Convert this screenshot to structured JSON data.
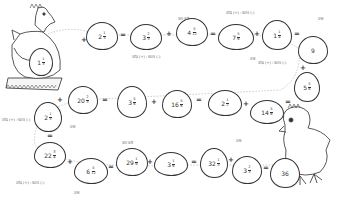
{
  "worksheet": {
    "eggs": [
      {
        "id": "e1",
        "whole": "1",
        "num": "1",
        "den": "3"
      },
      {
        "id": "e2",
        "whole": "2",
        "num": "1",
        "den": "3"
      },
      {
        "id": "e3",
        "whole": "3",
        "num": "2",
        "den": "3"
      },
      {
        "id": "e4",
        "whole": "4",
        "num": "5",
        "den": "12"
      },
      {
        "id": "e5",
        "whole": "7",
        "num": "5",
        "den": "6"
      },
      {
        "id": "e6",
        "whole": "1",
        "num": "1",
        "den": "4"
      },
      {
        "id": "e7",
        "whole": "9",
        "num": "",
        "den": ""
      },
      {
        "id": "e8",
        "whole": "5",
        "num": "5",
        "den": "6"
      },
      {
        "id": "e9",
        "whole": "14",
        "num": "5",
        "den": "6"
      },
      {
        "id": "e10",
        "whole": "2",
        "num": "1",
        "den": "2"
      },
      {
        "id": "e11",
        "whole": "16",
        "num": "5",
        "den": "6"
      },
      {
        "id": "e12",
        "whole": "3",
        "num": "5",
        "den": "6"
      },
      {
        "id": "e13",
        "whole": "20",
        "num": "2",
        "den": "3"
      },
      {
        "id": "e14",
        "whole": "2",
        "num": "1",
        "den": "3"
      },
      {
        "id": "e15",
        "whole": "22",
        "num": "3",
        "den": "4"
      },
      {
        "id": "e16",
        "whole": "6",
        "num": "5",
        "den": "12"
      },
      {
        "id": "e17",
        "whole": "29",
        "num": "1",
        "den": "6"
      },
      {
        "id": "e18",
        "whole": "3",
        "num": "1",
        "den": "6"
      },
      {
        "id": "e19",
        "whole": "32",
        "num": "1",
        "den": "3"
      },
      {
        "id": "e20",
        "whole": "3",
        "num": "2",
        "den": "3"
      },
      {
        "id": "e21",
        "whole": "36",
        "num": "",
        "den": ""
      }
    ],
    "operators": {
      "plus": "+",
      "equals": "="
    },
    "notes": {
      "n1": "ज्ञात करो",
      "n2": "जोड़ (+) : घटाव (-)",
      "n3": "उत्तर",
      "n4": "जोड़ (+) : घटाव (-)",
      "n5": "उत्तर",
      "n6": "जोड़ (+) : घटाव (-)",
      "n7": "जोड़ (+) : घटाव (-)",
      "n8": "उत्तर",
      "n9": "ज्ञात करो",
      "n10": "उत्तर",
      "n11": "जोड़ (+) : घटाव (-)",
      "n12": "उत्तर"
    }
  }
}
